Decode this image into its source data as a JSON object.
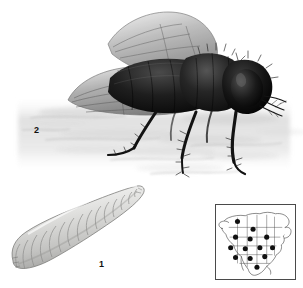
{
  "plate": {
    "title": "House fly life stages illustration plate",
    "background_color": "#ffffff",
    "width": 303,
    "height": 288
  },
  "figures": [
    {
      "id": "larva",
      "number": "1",
      "name": "fly-larva-maggot",
      "description": "Segmented cream-gray fly larva, blunt posterior at lower left tapering to pointed anterior at upper right",
      "label_position": {
        "x": 99,
        "y": 260
      }
    },
    {
      "id": "adult-fly",
      "number": "2",
      "name": "adult-house-fly",
      "description": "Adult house fly in left profile with two translucent veined wings raised, dark bristled thorax and abdomen, large compound eye, six legs standing on a shaded surface",
      "label_position": {
        "x": 34,
        "y": 126
      }
    }
  ],
  "labels": {
    "larva_number": "1",
    "adult_number": "2"
  },
  "map_inset": {
    "name": "north-america-distribution-map",
    "border_color": "#4a4a4a",
    "fill_color": "#ffffff",
    "outline_color": "#3a3a3a",
    "dot_color": "#101010",
    "box": {
      "x": 215,
      "y": 204,
      "width": 81,
      "height": 76
    },
    "dot_count": 13,
    "dots": [
      {
        "x": 22,
        "y": 17
      },
      {
        "x": 38,
        "y": 25
      },
      {
        "x": 20,
        "y": 33
      },
      {
        "x": 35,
        "y": 35
      },
      {
        "x": 52,
        "y": 33
      },
      {
        "x": 15,
        "y": 44
      },
      {
        "x": 30,
        "y": 45
      },
      {
        "x": 45,
        "y": 44
      },
      {
        "x": 20,
        "y": 54
      },
      {
        "x": 35,
        "y": 55
      },
      {
        "x": 50,
        "y": 53
      },
      {
        "x": 58,
        "y": 44
      },
      {
        "x": 42,
        "y": 64
      }
    ]
  },
  "colors": {
    "ink_dark": "#101010",
    "ink_mid": "#6a6a6a",
    "ink_light": "#b9b9b9",
    "wing_gray": "#9a9a9a",
    "larva_gray": "#cccccc",
    "ground_gray": "#d6d6d6",
    "background": "#ffffff"
  }
}
